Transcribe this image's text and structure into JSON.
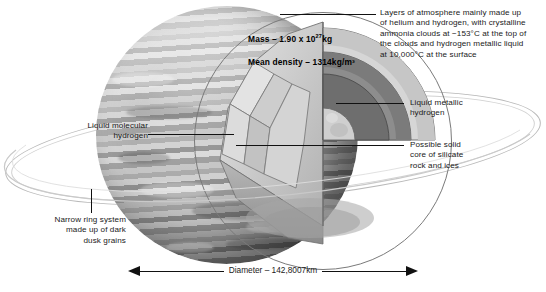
{
  "planet_stats": {
    "mass_label": "Mass – 1.90 x 10",
    "mass_exponent": "27",
    "mass_unit": "kg",
    "density_label": "Mean density – 1314kg/m³"
  },
  "annotations": {
    "atmosphere": "Layers of atmosphere mainly made up\nof helium and hydrogen, with crystalline\nammonia clouds at −153°C at the top of\nthe clouds and hydrogen metallic liquid\n at 10,000°C at the surface",
    "liquid_metallic_hydrogen": "Liquid metallic\nhydrogen",
    "core": "Possible solid\ncore of silicate\nrock and ices",
    "liquid_molecular_hydrogen": "Liquid molecular\nhydrogen",
    "ring_system": "Narrow ring system\nmade up of dark\ndusk grains"
  },
  "measurement": {
    "diameter": "Diameter – 142,8007km"
  },
  "colors": {
    "ink": "#1a1a1a",
    "leader": "#111111",
    "ring": "#b9b9b9",
    "planet_base": "#b4b4b4",
    "shell_outer": "#d9d9d9",
    "shell_mid": "#8d8d8d",
    "shell_inner": "#6e6e6e",
    "core": "#cccccc"
  }
}
